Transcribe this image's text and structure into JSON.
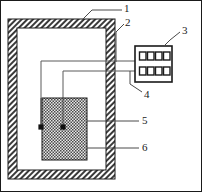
{
  "figure": {
    "type": "technical-schematic",
    "title": "",
    "canvas": {
      "width": 202,
      "height": 192
    },
    "colors": {
      "ink": "#1a1a1a",
      "line": "#4a4a4a",
      "hatch": "#3a3a3a",
      "fill_white": "#ffffff",
      "block_fill": "#9a9a9a",
      "page": "#ffffff"
    }
  },
  "callouts": [
    {
      "id": "callout-1",
      "label": "1",
      "x": 126,
      "y": 8,
      "target": "outer-hatched-frame"
    },
    {
      "id": "callout-2",
      "label": "2",
      "x": 126,
      "y": 22,
      "target": "inner-chamber-wall"
    },
    {
      "id": "callout-3",
      "label": "3",
      "x": 183,
      "y": 30,
      "target": "controller-box"
    },
    {
      "id": "callout-4",
      "label": "4",
      "x": 145,
      "y": 95,
      "target": "lower-lead-wire"
    },
    {
      "id": "callout-5",
      "label": "5",
      "x": 143,
      "y": 121,
      "target": "center-electrode-node"
    },
    {
      "id": "callout-6",
      "label": "6",
      "x": 143,
      "y": 148,
      "target": "cross-hatched-block"
    }
  ],
  "parts": {
    "outer_frame": {
      "name": "outer-hatched-frame",
      "x": 8,
      "y": 19,
      "w": 107,
      "h": 160,
      "wall": 9,
      "pattern": "diagonal-hatch"
    },
    "inner_chamber": {
      "name": "inner-chamber-wall",
      "x": 17,
      "y": 28,
      "w": 89,
      "h": 142,
      "pattern": "solid-outline"
    },
    "controller_box": {
      "name": "controller-box",
      "x": 135,
      "y": 46,
      "w": 37,
      "h": 36,
      "rows": 2,
      "cols": 4,
      "cell_label": "indicator-cell"
    },
    "block": {
      "name": "cross-hatched-block",
      "x": 42,
      "y": 98,
      "w": 45,
      "h": 62,
      "pattern": "cross-hatch"
    },
    "nodes": [
      {
        "name": "edge-electrode-node",
        "x": 41,
        "y": 127,
        "r": 2.6
      },
      {
        "name": "center-electrode-node",
        "x": 63,
        "y": 127,
        "r": 2.6
      }
    ],
    "wires": [
      {
        "name": "upper-lead-wire",
        "path": "M135,61 L41,61 L41,127"
      },
      {
        "name": "lower-lead-wire",
        "path": "M135,71 L63,71 L63,127"
      }
    ]
  }
}
